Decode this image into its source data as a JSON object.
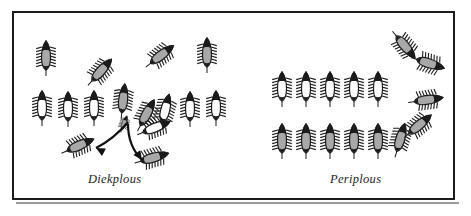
{
  "figure": {
    "type": "diagram",
    "background_color": "#ffffff",
    "frame_color": "#1b1b1b",
    "panels": [
      {
        "id": "diekplous",
        "caption": "Diekplous",
        "caption_style": "italic",
        "description": "breakthrough maneuver",
        "attacker_color": "#a8a8a8",
        "defender_color": "#ffffff"
      },
      {
        "id": "periplous",
        "caption": "Periplous",
        "caption_style": "italic",
        "description": "encirclement maneuver",
        "attacker_color": "#a8a8a8",
        "defender_color": "#ffffff"
      }
    ]
  },
  "ships": {
    "diekplous": [
      {
        "name": "ship-attacker-1",
        "x": 46,
        "y": 58,
        "rot": 0,
        "fill": "gray",
        "scale": 1.0
      },
      {
        "name": "ship-attacker-2",
        "x": 100,
        "y": 72,
        "rot": 42,
        "fill": "gray",
        "scale": 1.0
      },
      {
        "name": "ship-attacker-3",
        "x": 160,
        "y": 56,
        "rot": 52,
        "fill": "gray",
        "scale": 1.0
      },
      {
        "name": "ship-attacker-4",
        "x": 207,
        "y": 55,
        "rot": 0,
        "fill": "gray",
        "scale": 1.0
      },
      {
        "name": "ship-attacker-5",
        "x": 123,
        "y": 101,
        "rot": 6,
        "fill": "gray",
        "scale": 1.0
      },
      {
        "name": "ship-attacker-6",
        "x": 146,
        "y": 115,
        "rot": 28,
        "fill": "gray",
        "scale": 1.0
      },
      {
        "name": "ship-attacker-7",
        "x": 78,
        "y": 146,
        "rot": 66,
        "fill": "gray",
        "scale": 1.0
      },
      {
        "name": "ship-attacker-8",
        "x": 152,
        "y": 158,
        "rot": 74,
        "fill": "gray",
        "scale": 1.0
      },
      {
        "name": "ship-attacker-small",
        "x": 124,
        "y": 124,
        "rot": 20,
        "fill": "gray",
        "scale": 0.5
      },
      {
        "name": "ship-defender-1",
        "x": 42,
        "y": 108,
        "rot": 0,
        "fill": "white",
        "scale": 1.0
      },
      {
        "name": "ship-defender-2",
        "x": 68,
        "y": 109,
        "rot": 0,
        "fill": "white",
        "scale": 1.0
      },
      {
        "name": "ship-defender-3",
        "x": 94,
        "y": 108,
        "rot": 0,
        "fill": "white",
        "scale": 1.0
      },
      {
        "name": "ship-defender-4",
        "x": 165,
        "y": 111,
        "rot": 14,
        "fill": "white",
        "scale": 1.0
      },
      {
        "name": "ship-defender-5",
        "x": 154,
        "y": 128,
        "rot": 68,
        "fill": "white",
        "scale": 1.0
      },
      {
        "name": "ship-defender-6",
        "x": 190,
        "y": 109,
        "rot": 0,
        "fill": "white",
        "scale": 1.0
      },
      {
        "name": "ship-defender-7",
        "x": 216,
        "y": 108,
        "rot": 0,
        "fill": "white",
        "scale": 1.0
      }
    ],
    "periplous": [
      {
        "name": "ship-defender-1",
        "x": 282,
        "y": 89,
        "rot": 0,
        "fill": "white",
        "scale": 1.0
      },
      {
        "name": "ship-defender-2",
        "x": 306,
        "y": 89,
        "rot": 0,
        "fill": "white",
        "scale": 1.0
      },
      {
        "name": "ship-defender-3",
        "x": 330,
        "y": 89,
        "rot": 0,
        "fill": "white",
        "scale": 1.0
      },
      {
        "name": "ship-defender-4",
        "x": 354,
        "y": 89,
        "rot": 0,
        "fill": "white",
        "scale": 1.0
      },
      {
        "name": "ship-defender-5",
        "x": 378,
        "y": 89,
        "rot": 0,
        "fill": "white",
        "scale": 1.0
      },
      {
        "name": "ship-attacker-1",
        "x": 282,
        "y": 141,
        "rot": 0,
        "fill": "gray",
        "scale": 1.0
      },
      {
        "name": "ship-attacker-2",
        "x": 306,
        "y": 141,
        "rot": 0,
        "fill": "gray",
        "scale": 1.0
      },
      {
        "name": "ship-attacker-3",
        "x": 330,
        "y": 141,
        "rot": 0,
        "fill": "gray",
        "scale": 1.0
      },
      {
        "name": "ship-attacker-4",
        "x": 354,
        "y": 141,
        "rot": 0,
        "fill": "gray",
        "scale": 1.0
      },
      {
        "name": "ship-attacker-5",
        "x": 378,
        "y": 141,
        "rot": 0,
        "fill": "gray",
        "scale": 1.0
      },
      {
        "name": "ship-attacker-6",
        "x": 400,
        "y": 140,
        "rot": 16,
        "fill": "gray",
        "scale": 1.0
      },
      {
        "name": "ship-attacker-7",
        "x": 418,
        "y": 126,
        "rot": 50,
        "fill": "gray",
        "scale": 1.0
      },
      {
        "name": "ship-attacker-8",
        "x": 426,
        "y": 100,
        "rot": 82,
        "fill": "gray",
        "scale": 1.0
      },
      {
        "name": "ship-attacker-9",
        "x": 428,
        "y": 63,
        "rot": 108,
        "fill": "gray",
        "scale": 1.0
      },
      {
        "name": "ship-attacker-10",
        "x": 404,
        "y": 45,
        "rot": 140,
        "fill": "gray",
        "scale": 1.0
      }
    ]
  },
  "arrows": [
    {
      "name": "arrow-breakthrough-left",
      "path": "M 128 122 C 118 134 108 142 96 148",
      "head_angle": 208
    },
    {
      "name": "arrow-breakthrough-right",
      "path": "M 128 124 C 128 140 134 152 142 160",
      "head_angle": 55
    }
  ]
}
